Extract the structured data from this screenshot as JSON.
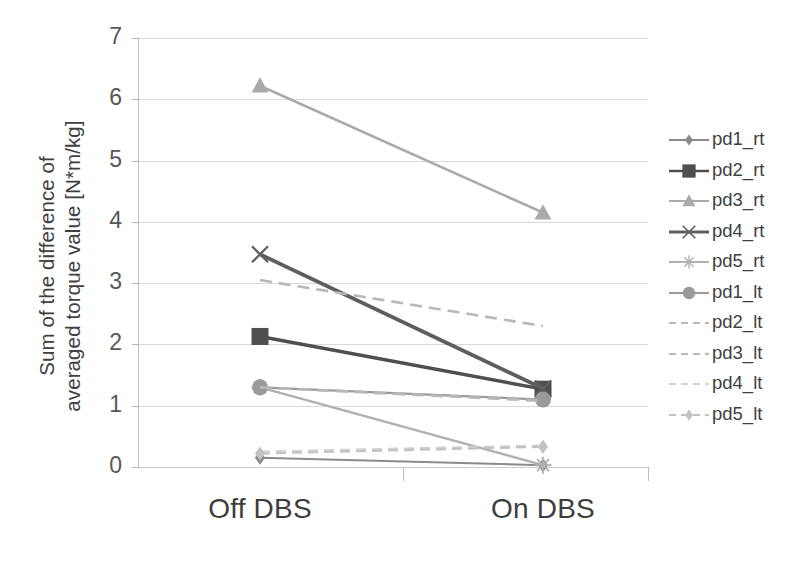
{
  "chart_data": {
    "type": "line",
    "title": "",
    "subtitle": "",
    "xlabel": "",
    "ylabel": "Sum of the difference of\naveraged torque value [N*m/kg]",
    "categories": [
      "Off DBS",
      "On DBS"
    ],
    "x_tick_labels": [
      "Off DBS",
      "On DBS"
    ],
    "y_tick_labels": [
      "0",
      "1",
      "2",
      "3",
      "4",
      "5",
      "6",
      "7"
    ],
    "y_ticks": [
      0,
      1,
      2,
      3,
      4,
      5,
      6,
      7
    ],
    "ylim": [
      0,
      7
    ],
    "grid": "horizontal",
    "legend_position": "right",
    "series": [
      {
        "name": "pd1_rt",
        "values": [
          0.15,
          0.03
        ],
        "marker": "diamond",
        "color": "#8a8a8a",
        "dash": "none",
        "width": 2.0
      },
      {
        "name": "pd2_rt",
        "values": [
          2.13,
          1.27
        ],
        "marker": "square",
        "color": "#4f4f4f",
        "dash": "none",
        "width": 3.4
      },
      {
        "name": "pd3_rt",
        "values": [
          6.22,
          4.15
        ],
        "marker": "triangle",
        "color": "#aaaaaa",
        "dash": "none",
        "width": 2.6
      },
      {
        "name": "pd4_rt",
        "values": [
          3.47,
          1.28
        ],
        "marker": "cross",
        "color": "#5e5e5e",
        "dash": "none",
        "width": 3.8
      },
      {
        "name": "pd5_rt",
        "values": [
          1.3,
          0.03
        ],
        "marker": "star",
        "color": "#b0b0b0",
        "dash": "none",
        "width": 2.4
      },
      {
        "name": "pd1_lt",
        "values": [
          1.3,
          1.1
        ],
        "marker": "circle",
        "color": "#9a9a9a",
        "dash": "none",
        "width": 2.2
      },
      {
        "name": "pd2_lt",
        "values": [
          1.3,
          1.08
        ],
        "marker": "none",
        "color": "#b8b8b8",
        "dash": "12,7",
        "width": 2.8
      },
      {
        "name": "pd3_lt",
        "values": [
          3.05,
          2.3
        ],
        "marker": "none",
        "color": "#b8b8b8",
        "dash": "12,7",
        "width": 2.6
      },
      {
        "name": "pd4_lt",
        "values": [
          0.25,
          0.35
        ],
        "marker": "none",
        "color": "#d2d2d2",
        "dash": "10,6",
        "width": 2.2
      },
      {
        "name": "pd5_lt",
        "values": [
          0.22,
          0.33
        ],
        "marker": "diamond",
        "color": "#c2c2c2",
        "dash": "10,6",
        "width": 2.2
      }
    ]
  },
  "axes": {
    "y_title": "Sum of the difference of\naveraged torque value [N*m/kg]",
    "y_labels": [
      "7",
      "6",
      "5",
      "4",
      "3",
      "2",
      "1",
      "0"
    ],
    "x_labels": [
      "Off DBS",
      "On DBS"
    ]
  },
  "legend": {
    "items": [
      {
        "label": "pd1_rt"
      },
      {
        "label": "pd2_rt"
      },
      {
        "label": "pd3_rt"
      },
      {
        "label": "pd4_rt"
      },
      {
        "label": "pd5_rt"
      },
      {
        "label": "pd1_lt"
      },
      {
        "label": "pd2_lt"
      },
      {
        "label": "pd3_lt"
      },
      {
        "label": "pd4_lt"
      },
      {
        "label": "pd5_lt"
      }
    ]
  },
  "colors": {
    "grid": "#d9d9d9",
    "axis": "#bfbfbf",
    "text": "#3f3f3f",
    "background": "#ffffff"
  }
}
